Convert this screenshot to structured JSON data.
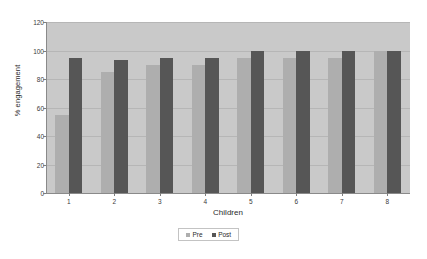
{
  "chart_data": {
    "type": "bar",
    "title": "",
    "subtitle": "",
    "xlabel": "Children",
    "ylabel": "% engagement",
    "categories": [
      "1",
      "2",
      "3",
      "4",
      "5",
      "6",
      "7",
      "8"
    ],
    "series": [
      {
        "name": "Pre",
        "color": "#aeaeae",
        "values": [
          55,
          85,
          90,
          90,
          95,
          95,
          95,
          100
        ]
      },
      {
        "name": "Post",
        "color": "#565656",
        "values": [
          95,
          93,
          95,
          95,
          100,
          100,
          100,
          100
        ]
      }
    ],
    "ylim": [
      0,
      120
    ],
    "yticks": [
      0,
      20,
      40,
      60,
      80,
      100,
      120
    ],
    "ytick_labels": [
      "0",
      "20",
      "40",
      "60",
      "80",
      "100",
      "120"
    ],
    "grid": true,
    "grid_axis": "y",
    "legend_position": "bottom",
    "plot_background": "#c9c9c9",
    "figure_background": "#ffffff"
  },
  "legend": {
    "items": [
      {
        "label": "Pre"
      },
      {
        "label": "Post"
      }
    ]
  }
}
